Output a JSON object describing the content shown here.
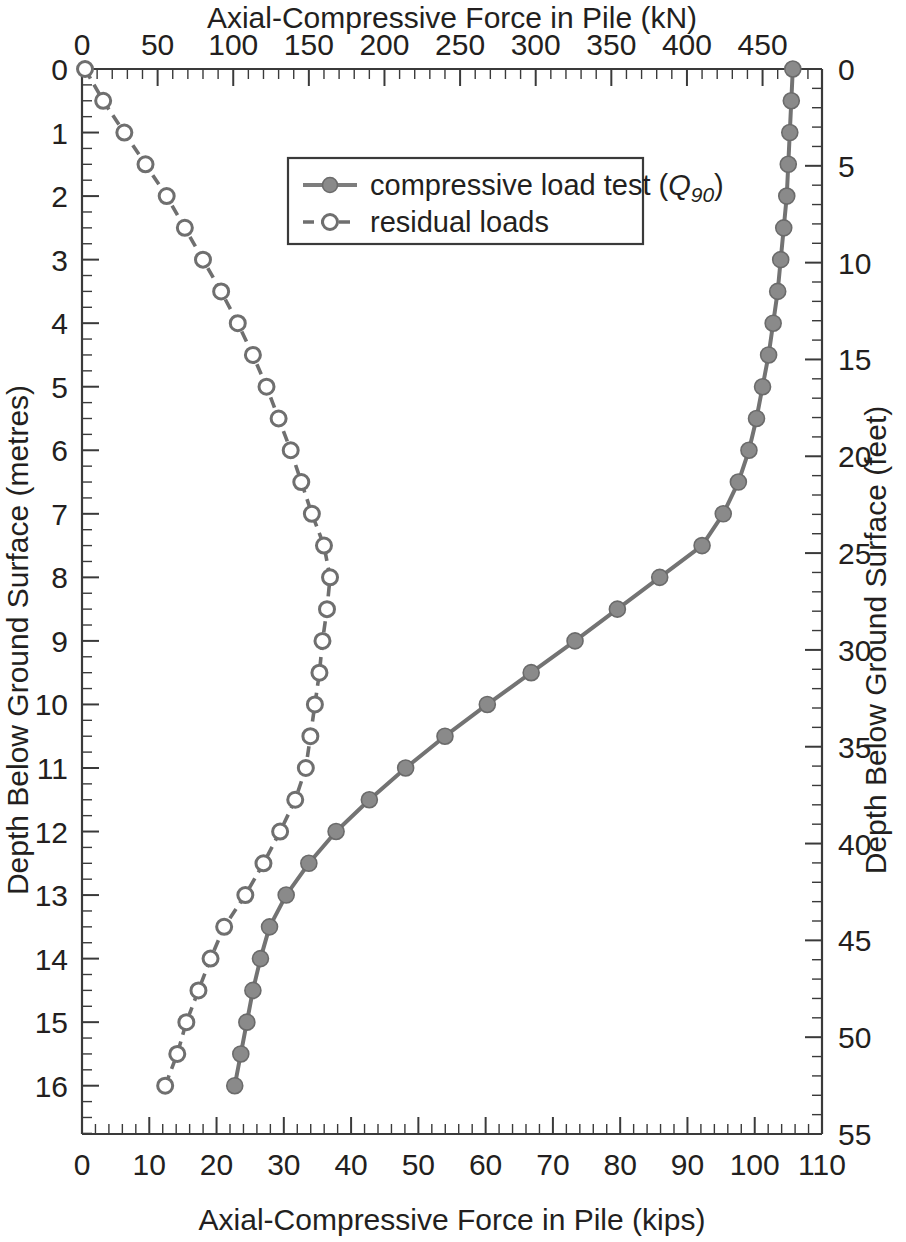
{
  "chart_data": {
    "type": "line",
    "title": "",
    "top_axis": {
      "label": "Axial-Compressive Force in Pile (kN)",
      "ticks": [
        0,
        50,
        100,
        150,
        200,
        250,
        300,
        350,
        400,
        450
      ],
      "range": [
        0,
        489.3
      ],
      "minor_interval": 10
    },
    "bottom_axis": {
      "label": "Axial-Compressive Force in Pile (kips)",
      "ticks": [
        0,
        10,
        20,
        30,
        40,
        50,
        60,
        70,
        80,
        90,
        100,
        110
      ],
      "range": [
        0,
        110
      ],
      "minor_interval": 2
    },
    "left_axis": {
      "label": "Depth Below Ground Surface (metres)",
      "ticks": [
        0,
        1,
        2,
        3,
        4,
        5,
        6,
        7,
        8,
        9,
        10,
        11,
        12,
        13,
        14,
        15,
        16
      ],
      "range": [
        0,
        16.76
      ],
      "minor_interval": 0.25,
      "inverted": true
    },
    "right_axis": {
      "label": "Depth Below Ground Surface (feet)",
      "ticks": [
        0,
        5,
        10,
        15,
        20,
        25,
        30,
        35,
        40,
        45,
        50,
        55
      ],
      "range": [
        0,
        55
      ],
      "minor_interval": 1,
      "inverted": true
    },
    "grid": false,
    "legend_position": "upper-center",
    "series": [
      {
        "name": "compressive load test (Q90)",
        "legend_label": "compressive load test (",
        "legend_symbol": "Q",
        "legend_subscript": "90",
        "legend_suffix": ")",
        "style": "solid",
        "marker": "filled-circle",
        "color": "#7d7d7d",
        "x_unit": "kN",
        "y_unit": "m",
        "points": [
          [
            470,
            0.0
          ],
          [
            469,
            0.5
          ],
          [
            468,
            1.0
          ],
          [
            467,
            1.5
          ],
          [
            466,
            2.0
          ],
          [
            464,
            2.5
          ],
          [
            462,
            3.0
          ],
          [
            460,
            3.5
          ],
          [
            457,
            4.0
          ],
          [
            454,
            4.5
          ],
          [
            450,
            5.0
          ],
          [
            446,
            5.5
          ],
          [
            441,
            6.0
          ],
          [
            434,
            6.5
          ],
          [
            424,
            7.0
          ],
          [
            410,
            7.5
          ],
          [
            382,
            8.0
          ],
          [
            354,
            8.5
          ],
          [
            326,
            9.0
          ],
          [
            297,
            9.5
          ],
          [
            268,
            10.0
          ],
          [
            240,
            10.5
          ],
          [
            214,
            11.0
          ],
          [
            190,
            11.5
          ],
          [
            168,
            12.0
          ],
          [
            150,
            12.5
          ],
          [
            135,
            13.0
          ],
          [
            124,
            13.5
          ],
          [
            118,
            14.0
          ],
          [
            113,
            14.5
          ],
          [
            109,
            15.0
          ],
          [
            105,
            15.5
          ],
          [
            101,
            16.0
          ]
        ]
      },
      {
        "name": "residual loads",
        "legend_label": "residual loads",
        "style": "dashed",
        "marker": "open-circle",
        "color": "#6f6f6f",
        "x_unit": "kN",
        "y_unit": "m",
        "points": [
          [
            2,
            0.0
          ],
          [
            14,
            0.5
          ],
          [
            28,
            1.0
          ],
          [
            42,
            1.5
          ],
          [
            56,
            2.0
          ],
          [
            68,
            2.5
          ],
          [
            80,
            3.0
          ],
          [
            92,
            3.5
          ],
          [
            103,
            4.0
          ],
          [
            113,
            4.5
          ],
          [
            122,
            5.0
          ],
          [
            130,
            5.5
          ],
          [
            138,
            6.0
          ],
          [
            145,
            6.5
          ],
          [
            152,
            7.0
          ],
          [
            160,
            7.5
          ],
          [
            164,
            8.0
          ],
          [
            162,
            8.5
          ],
          [
            159,
            9.0
          ],
          [
            157,
            9.5
          ],
          [
            154,
            10.0
          ],
          [
            151,
            10.5
          ],
          [
            148,
            11.0
          ],
          [
            141,
            11.5
          ],
          [
            131,
            12.0
          ],
          [
            120,
            12.5
          ],
          [
            108,
            13.0
          ],
          [
            94,
            13.5
          ],
          [
            85,
            14.0
          ],
          [
            77,
            14.5
          ],
          [
            69,
            15.0
          ],
          [
            63,
            15.5
          ],
          [
            55,
            16.0
          ]
        ]
      }
    ]
  },
  "legend": {
    "items": [
      {
        "label_prefix": "compressive load test (",
        "q": "Q",
        "sub": "90",
        "label_suffix": ")"
      },
      {
        "label_plain": "residual loads"
      }
    ]
  },
  "axis_titles": {
    "top": "Axial-Compressive Force in Pile (kN)",
    "bottom": "Axial-Compressive Force in Pile (kips)",
    "left": "Depth Below Ground Surface (metres)",
    "right": "Depth Below Ground Surface (feet)"
  }
}
